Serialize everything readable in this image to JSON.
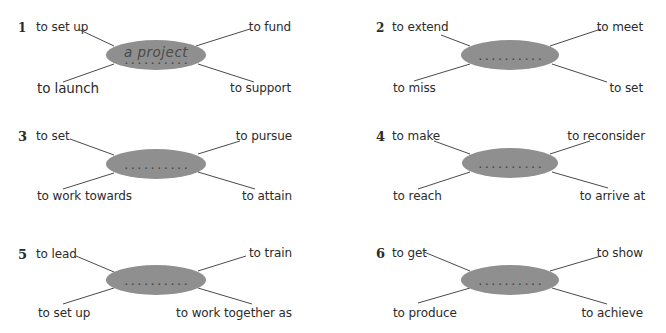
{
  "exercise": {
    "type": "collocation spidergrams",
    "ellipse_color": "#8f8f8f",
    "line_color": "#4a4a4a",
    "text_color": "#2b2b2b",
    "blank_placeholder": "..........",
    "items": [
      {
        "number": "1",
        "answer": "a project",
        "top_left": "to set up",
        "top_right": "to fund",
        "bottom_left": "to launch",
        "bottom_right": "to support"
      },
      {
        "number": "2",
        "answer": "",
        "top_left": "to extend",
        "top_right": "to meet",
        "bottom_left": "to miss",
        "bottom_right": "to set"
      },
      {
        "number": "3",
        "answer": "",
        "top_left": "to set",
        "top_right": "to pursue",
        "bottom_left": "to work towards",
        "bottom_right": "to attain"
      },
      {
        "number": "4",
        "answer": "",
        "top_left": "to make",
        "top_right": "to reconsider",
        "bottom_left": "to reach",
        "bottom_right": "to arrive at"
      },
      {
        "number": "5",
        "answer": "",
        "top_left": "to lead",
        "top_right": "to train",
        "bottom_left": "to set up",
        "bottom_right": "to work together as"
      },
      {
        "number": "6",
        "answer": "",
        "top_left": "to get",
        "top_right": "to show",
        "bottom_left": "to produce",
        "bottom_right": "to achieve"
      }
    ]
  }
}
